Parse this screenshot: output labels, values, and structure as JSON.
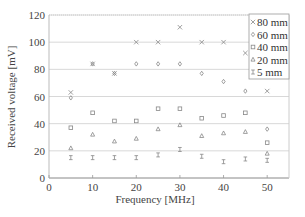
{
  "chart_data": {
    "type": "scatter",
    "title": "",
    "xlabel": "Frequency [MHz]",
    "ylabel": "Received voltage [mV]",
    "xlim": [
      0,
      55
    ],
    "ylim": [
      0,
      120
    ],
    "xticks": [
      0,
      10,
      20,
      30,
      40,
      50
    ],
    "yticks": [
      0,
      20,
      40,
      60,
      80,
      100,
      120
    ],
    "grid": "horizontal",
    "legend_position": "upper right",
    "x": [
      5,
      10,
      15,
      20,
      25,
      30,
      35,
      40,
      45,
      50
    ],
    "series": [
      {
        "name": "80 mm",
        "marker": "x",
        "values": [
          63,
          84,
          77,
          100,
          100,
          111,
          100,
          100,
          92,
          64
        ]
      },
      {
        "name": "60 mm",
        "marker": "diamond",
        "values": [
          59,
          84,
          77,
          84,
          84,
          84,
          77,
          71,
          64,
          36
        ]
      },
      {
        "name": "40 mm",
        "marker": "square",
        "values": [
          37,
          48,
          42,
          42,
          51,
          51,
          44,
          46,
          48,
          26
        ]
      },
      {
        "name": "20 mm",
        "marker": "triangle",
        "values": [
          22,
          32,
          27,
          29,
          36,
          39,
          31,
          33,
          34,
          18
        ]
      },
      {
        "name": "5 mm",
        "marker": "hourglass",
        "values": [
          15,
          15,
          15,
          15,
          17,
          21,
          16,
          12,
          14,
          13
        ]
      }
    ]
  }
}
